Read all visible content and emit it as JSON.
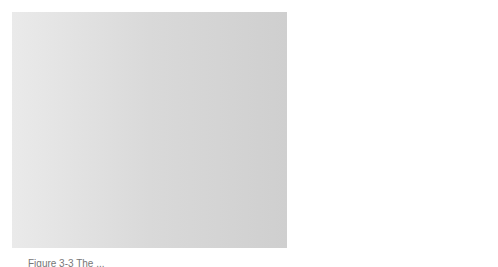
{
  "figure": {
    "labels": {
      "upwash": "Upwash",
      "lift": "Lift",
      "total_reaction_line1": "Total",
      "total_reaction_line2": "Reaction",
      "drag": "Drag",
      "chord_line": "Chord Line",
      "angle_of_attack": "Angle of Attack",
      "alpha": "α",
      "downwash": "Downwash"
    },
    "colors": {
      "background": "#d6d6d6",
      "streamline": "#3a3a3a",
      "airfoil": "#ffffff",
      "label_border": "#111111",
      "label_fill": "#ffffff"
    },
    "caption": "Figure 3-3 The ..."
  }
}
